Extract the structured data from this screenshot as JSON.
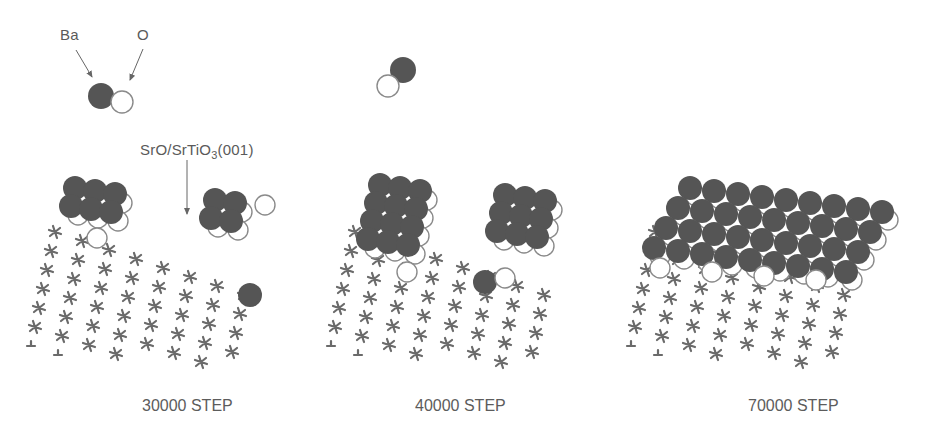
{
  "legend": {
    "ba_label": "Ba",
    "o_label": "O",
    "substrate_label_main": "SrO/SrTiO",
    "substrate_label_sub": "3",
    "substrate_label_tail": "(001)"
  },
  "colors": {
    "ba_fill": "#555555",
    "o_fill": "#ffffff",
    "o_stroke": "#8a8a8a",
    "lattice": "#6a6a6a",
    "text": "#5a5a5a"
  },
  "panels": [
    {
      "id": "panel-30000",
      "caption": "30000 STEP",
      "caption_x": 142,
      "origin_x": 45,
      "coverage": "partial-two-islands"
    },
    {
      "id": "panel-40000",
      "caption": "40000 STEP",
      "caption_x": 415,
      "origin_x": 345,
      "coverage": "larger-two-islands"
    },
    {
      "id": "panel-70000",
      "caption": "70000 STEP",
      "caption_x": 748,
      "origin_x": 645,
      "coverage": "full-layer"
    }
  ]
}
